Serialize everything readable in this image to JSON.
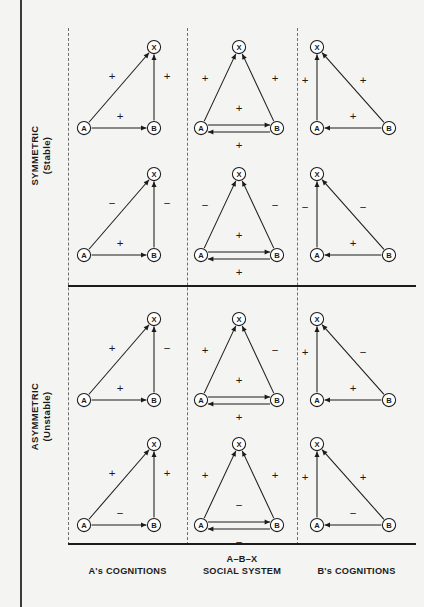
{
  "figure": {
    "row_labels": [
      {
        "line1": "SYMMETRIC",
        "line2": "(Stable)"
      },
      {
        "line1": "ASYMMETRIC",
        "line2": "(Unstable)"
      }
    ],
    "column_labels": [
      {
        "line1": "",
        "line2": "A's COGNITIONS"
      },
      {
        "line1": "A–B–X",
        "line2": "SOCIAL SYSTEM"
      },
      {
        "line1": "",
        "line2": "B's COGNITIONS"
      }
    ],
    "node_labels": {
      "a": "A",
      "b": "B",
      "x": "X"
    },
    "signs": {
      "positive": "+",
      "negative": "−"
    },
    "colors": {
      "ink": "#1b1b1b",
      "dash": "#6f6f6f",
      "paper": "#f4f4f2"
    }
  },
  "chart_data": {
    "type": "diagram",
    "layout": {
      "rows": 4,
      "columns": 3,
      "grid": "row-major"
    },
    "row_groups": [
      {
        "name": "SYMMETRIC (Stable)",
        "rows": [
          0,
          1
        ]
      },
      {
        "name": "ASYMMETRIC (Unstable)",
        "rows": [
          2,
          3
        ]
      }
    ],
    "columns": [
      "A's COGNITIONS",
      "A–B–X SOCIAL SYSTEM",
      "B's COGNITIONS"
    ],
    "cells": [
      {
        "row": 0,
        "col": 0,
        "kind": "a-cognitions",
        "edges": [
          {
            "from": "A",
            "to": "X",
            "sign": "+"
          },
          {
            "from": "B",
            "to": "X",
            "sign": "+"
          },
          {
            "from": "A",
            "to": "B",
            "sign": "+"
          }
        ]
      },
      {
        "row": 0,
        "col": 1,
        "kind": "social-system",
        "edges": [
          {
            "from": "A",
            "to": "X",
            "sign": "+"
          },
          {
            "from": "B",
            "to": "X",
            "sign": "+"
          },
          {
            "from": "A",
            "to": "B",
            "sign": "+"
          },
          {
            "from": "B",
            "to": "A",
            "sign": "+"
          }
        ]
      },
      {
        "row": 0,
        "col": 2,
        "kind": "b-cognitions",
        "edges": [
          {
            "from": "A",
            "to": "X",
            "sign": "+"
          },
          {
            "from": "B",
            "to": "X",
            "sign": "+"
          },
          {
            "from": "B",
            "to": "A",
            "sign": "+"
          }
        ]
      },
      {
        "row": 1,
        "col": 0,
        "kind": "a-cognitions",
        "edges": [
          {
            "from": "A",
            "to": "X",
            "sign": "−"
          },
          {
            "from": "B",
            "to": "X",
            "sign": "−"
          },
          {
            "from": "A",
            "to": "B",
            "sign": "+"
          }
        ]
      },
      {
        "row": 1,
        "col": 1,
        "kind": "social-system",
        "edges": [
          {
            "from": "A",
            "to": "X",
            "sign": "−"
          },
          {
            "from": "B",
            "to": "X",
            "sign": "−"
          },
          {
            "from": "A",
            "to": "B",
            "sign": "+"
          },
          {
            "from": "B",
            "to": "A",
            "sign": "+"
          }
        ]
      },
      {
        "row": 1,
        "col": 2,
        "kind": "b-cognitions",
        "edges": [
          {
            "from": "A",
            "to": "X",
            "sign": "−"
          },
          {
            "from": "B",
            "to": "X",
            "sign": "−"
          },
          {
            "from": "B",
            "to": "A",
            "sign": "+"
          }
        ]
      },
      {
        "row": 2,
        "col": 0,
        "kind": "a-cognitions",
        "edges": [
          {
            "from": "A",
            "to": "X",
            "sign": "+"
          },
          {
            "from": "B",
            "to": "X",
            "sign": "−"
          },
          {
            "from": "A",
            "to": "B",
            "sign": "+"
          }
        ]
      },
      {
        "row": 2,
        "col": 1,
        "kind": "social-system",
        "edges": [
          {
            "from": "A",
            "to": "X",
            "sign": "+"
          },
          {
            "from": "B",
            "to": "X",
            "sign": "−"
          },
          {
            "from": "A",
            "to": "B",
            "sign": "+"
          },
          {
            "from": "B",
            "to": "A",
            "sign": "+"
          }
        ]
      },
      {
        "row": 2,
        "col": 2,
        "kind": "b-cognitions",
        "edges": [
          {
            "from": "A",
            "to": "X",
            "sign": "+"
          },
          {
            "from": "B",
            "to": "X",
            "sign": "−"
          },
          {
            "from": "B",
            "to": "A",
            "sign": "+"
          }
        ]
      },
      {
        "row": 3,
        "col": 0,
        "kind": "a-cognitions",
        "edges": [
          {
            "from": "A",
            "to": "X",
            "sign": "+"
          },
          {
            "from": "B",
            "to": "X",
            "sign": "+"
          },
          {
            "from": "A",
            "to": "B",
            "sign": "−"
          }
        ]
      },
      {
        "row": 3,
        "col": 1,
        "kind": "social-system",
        "edges": [
          {
            "from": "A",
            "to": "X",
            "sign": "+"
          },
          {
            "from": "B",
            "to": "X",
            "sign": "+"
          },
          {
            "from": "A",
            "to": "B",
            "sign": "−"
          },
          {
            "from": "B",
            "to": "A",
            "sign": "−"
          }
        ]
      },
      {
        "row": 3,
        "col": 2,
        "kind": "b-cognitions",
        "edges": [
          {
            "from": "A",
            "to": "X",
            "sign": "+"
          },
          {
            "from": "B",
            "to": "X",
            "sign": "+"
          },
          {
            "from": "B",
            "to": "A",
            "sign": "−"
          }
        ]
      }
    ]
  }
}
